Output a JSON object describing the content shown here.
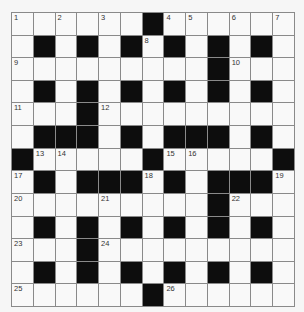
{
  "puzzle": {
    "type": "crossword",
    "rows": 13,
    "cols": 13,
    "colors": {
      "black": "#0d0d0d",
      "white": "#f9f9f9",
      "grid_line": "#8a8a8a",
      "background": "#f6f6f6"
    },
    "layout": [
      "1.2.3.#45.6.7",
      ".#.#.#8#.#.#.",
      "9........#A..",
      ".#.#.#.#.#.#.",
      "B..#C........",
      ".###.#.###.#.",
      "#DE...#FG...#",
      "H#.###I#.###J",
      "K...L....#M..",
      ".#.#.#.#.#.#.",
      "N..#O........",
      ".#.#.#.#.#.#.",
      "P.....#Q....."
    ],
    "grid": [
      [
        "1",
        "",
        "2",
        "",
        "3",
        "",
        "#",
        "4",
        "5",
        "",
        "6",
        "",
        "7"
      ],
      [
        "",
        "#",
        "",
        "#",
        "",
        "#",
        "8",
        "#",
        "",
        "#",
        "",
        "#",
        ""
      ],
      [
        "9",
        "",
        "",
        "",
        "",
        "",
        "",
        "",
        "",
        "#",
        "10",
        "",
        ""
      ],
      [
        "",
        "#",
        "",
        "#",
        "",
        "#",
        "",
        "#",
        "",
        "#",
        "",
        "#",
        ""
      ],
      [
        "11",
        "",
        "",
        "#",
        "12",
        "",
        "",
        "",
        "",
        "",
        "",
        "",
        ""
      ],
      [
        "",
        "#",
        "#",
        "#",
        "",
        "#",
        "",
        "#",
        "#",
        "#",
        "",
        "#",
        ""
      ],
      [
        "#",
        "13",
        "14",
        "",
        "",
        "",
        "#",
        "15",
        "16",
        "",
        "",
        "",
        "#"
      ],
      [
        "17",
        "#",
        "",
        "#",
        "#",
        "#",
        "18",
        "#",
        "",
        "#",
        "#",
        "#",
        "19"
      ],
      [
        "20",
        "",
        "",
        "",
        "21",
        "",
        "",
        "",
        "",
        "#",
        "22",
        "",
        ""
      ],
      [
        "",
        "#",
        "",
        "#",
        "",
        "#",
        "",
        "#",
        "",
        "#",
        "",
        "#",
        ""
      ],
      [
        "23",
        "",
        "",
        "#",
        "24",
        "",
        "",
        "",
        "",
        "",
        "",
        "",
        ""
      ],
      [
        "",
        "#",
        "",
        "#",
        "",
        "#",
        "",
        "#",
        "",
        "#",
        "",
        "#",
        ""
      ],
      [
        "25",
        "",
        "",
        "",
        "",
        "",
        "#",
        "26",
        "",
        "",
        "",
        "",
        ""
      ]
    ]
  }
}
